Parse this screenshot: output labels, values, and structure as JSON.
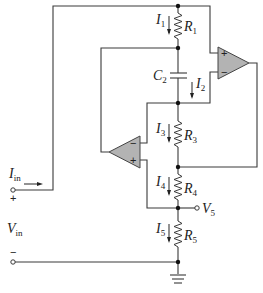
{
  "diagram": {
    "type": "circuit-schematic",
    "title": "",
    "labels": {
      "I1": {
        "main": "I",
        "sub": "1"
      },
      "R1": {
        "main": "R",
        "sub": "1"
      },
      "C2": {
        "main": "C",
        "sub": "2"
      },
      "I2": {
        "main": "I",
        "sub": "2"
      },
      "I3": {
        "main": "I",
        "sub": "3"
      },
      "R3": {
        "main": "R",
        "sub": "3"
      },
      "I4": {
        "main": "I",
        "sub": "4"
      },
      "R4": {
        "main": "R",
        "sub": "4"
      },
      "V5": {
        "main": "V",
        "sub": "5"
      },
      "I5": {
        "main": "I",
        "sub": "5"
      },
      "R5": {
        "main": "R",
        "sub": "5"
      },
      "Iin": {
        "main": "I",
        "sub": "in"
      },
      "Vin": {
        "main": "V",
        "sub": "in"
      }
    },
    "terminal_signs": {
      "plus": "+",
      "minus": "−"
    },
    "opamp1": {
      "plus": "+",
      "minus": "−"
    },
    "opamp2": {
      "plus": "+",
      "minus": "−"
    },
    "components": [
      "R1",
      "C2",
      "R3",
      "R4",
      "R5",
      "opamp1",
      "opamp2",
      "ground"
    ],
    "colors": {
      "wire": "#3a3a3a",
      "opamp_fill": "#b3b3b3",
      "background": "#ffffff"
    }
  }
}
